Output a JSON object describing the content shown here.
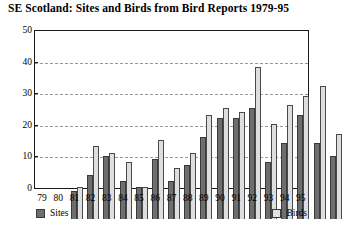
{
  "chart_data": {
    "type": "bar",
    "title": "SE Scotland:  Sites and Birds from Bird Reports 1979-95",
    "xlabel": "",
    "ylabel": "",
    "ylim": [
      0,
      50
    ],
    "yticks": [
      0,
      10,
      20,
      30,
      40,
      50
    ],
    "grid": true,
    "legend_position": "bottom",
    "categories": [
      "79",
      "80",
      "81",
      "82",
      "83",
      "84",
      "85",
      "86",
      "87",
      "88",
      "89",
      "90",
      "91",
      "92",
      "93",
      "94",
      "95"
    ],
    "series": [
      {
        "name": "Sites",
        "color": "#6e6e6e",
        "values": [
          9,
          14,
          20,
          12,
          10,
          19,
          12,
          17,
          26,
          32,
          32,
          35,
          18,
          24,
          33,
          24,
          20
        ]
      },
      {
        "name": "Birds",
        "color": "#dedede",
        "values": [
          10,
          23,
          21,
          18,
          10,
          25,
          16,
          21,
          33,
          35,
          34,
          48,
          30,
          36,
          39,
          42,
          27
        ]
      }
    ]
  },
  "legend": {
    "sites_label": "Sites",
    "birds_label": "Birds"
  }
}
